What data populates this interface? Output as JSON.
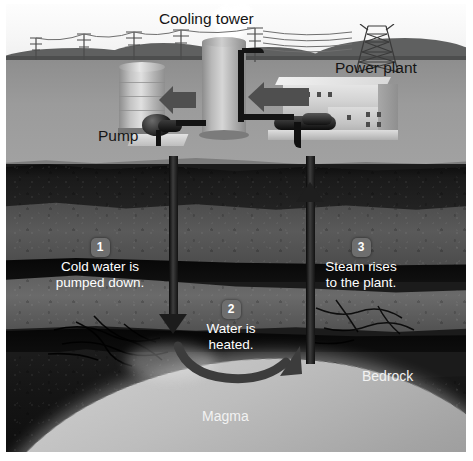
{
  "diagram": {
    "surface_labels": [
      {
        "id": "cooling-tower",
        "text": "Cooling tower"
      },
      {
        "id": "power-plant",
        "text": "Power plant"
      },
      {
        "id": "pump",
        "text": "Pump"
      }
    ],
    "underground_labels": [
      {
        "id": "bedrock",
        "text": "Bedrock"
      },
      {
        "id": "magma",
        "text": "Magma"
      }
    ],
    "steps": [
      {
        "number": "1",
        "line1": "Cold water is",
        "line2": "pumped down."
      },
      {
        "number": "2",
        "line1": "Water is",
        "line2": "heated."
      },
      {
        "number": "3",
        "line1": "Steam rises",
        "line2": "to the plant."
      }
    ],
    "colors": {
      "sky": "#fafafa",
      "hills": "#5f6060",
      "ground": "#9b9b9b",
      "rock_light": "#5e5e5e",
      "rock_dark": "#0b0b0b",
      "magma": "#c9c9c9",
      "badge": "#6e6e6e",
      "label_light": "#f2f2f2",
      "label_dark": "#151515",
      "arrow": "#4f4f4f"
    }
  }
}
